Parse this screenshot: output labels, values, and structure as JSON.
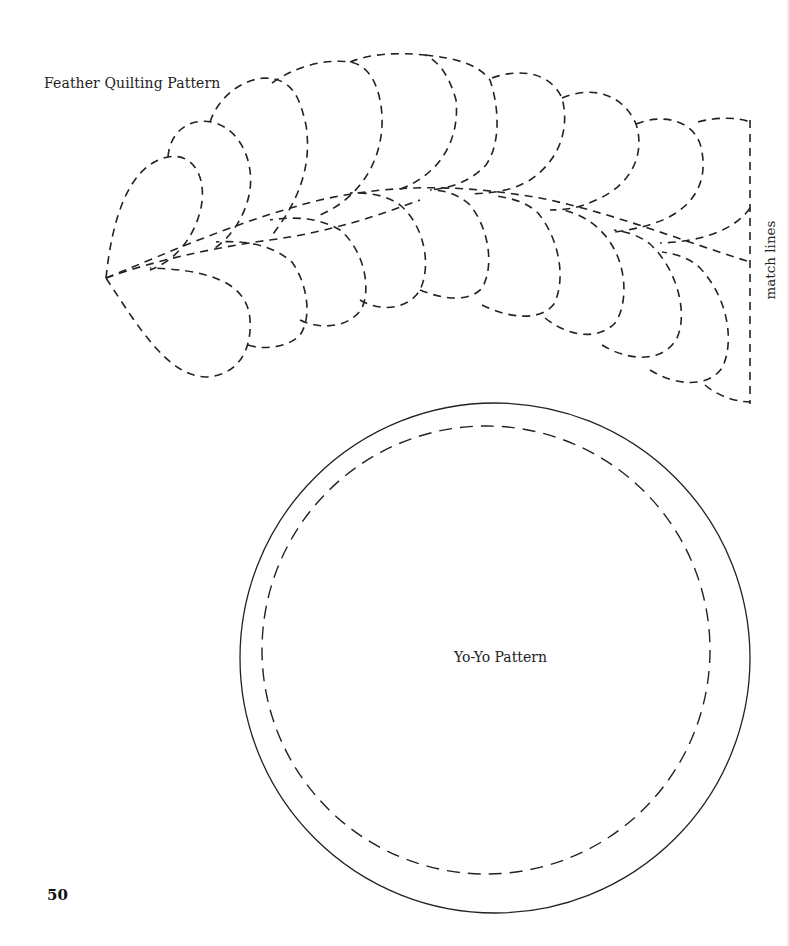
{
  "page": {
    "number": "50"
  },
  "feather_pattern": {
    "title": "Feather Quilting Pattern",
    "match_label": "match lines",
    "line_style": "dashed",
    "color": "#222222"
  },
  "yoyo_pattern": {
    "title": "Yo-Yo Pattern",
    "outer_circle_style": "solid",
    "inner_circle_style": "dashed",
    "color": "#222222"
  }
}
